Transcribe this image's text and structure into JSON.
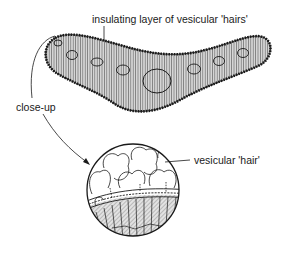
{
  "labels": {
    "insulating_layer": "insulating layer of vesicular 'hairs'",
    "close_up": "close-up",
    "vesicular_hair": "vesicular 'hair'"
  },
  "colors": {
    "ink": "#1a1a1a",
    "hatch": "#8a8a8a",
    "background": "#ffffff"
  }
}
